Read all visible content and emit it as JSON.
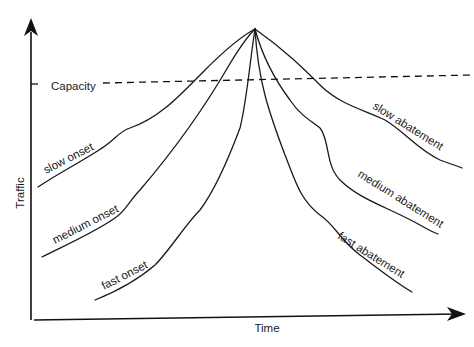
{
  "diagram": {
    "axes": {
      "x_label": "Time",
      "y_label": "Traffic"
    },
    "capacity_label": "Capacity",
    "curves": [
      {
        "id": "slow-onset",
        "label": "slow onset",
        "phase": "onset",
        "speed": "slow"
      },
      {
        "id": "medium-onset",
        "label": "medium onset",
        "phase": "onset",
        "speed": "medium"
      },
      {
        "id": "fast-onset",
        "label": "fast onset",
        "phase": "onset",
        "speed": "fast"
      },
      {
        "id": "slow-abatement",
        "label": "slow abatement",
        "phase": "abatement",
        "speed": "slow"
      },
      {
        "id": "medium-abatement",
        "label": "medium abatement",
        "phase": "abatement",
        "speed": "medium"
      },
      {
        "id": "fast-abatement",
        "label": "fast abatement",
        "phase": "abatement",
        "speed": "fast"
      }
    ],
    "colors": {
      "ink": "#1a1a1a",
      "background": "#ffffff"
    }
  }
}
